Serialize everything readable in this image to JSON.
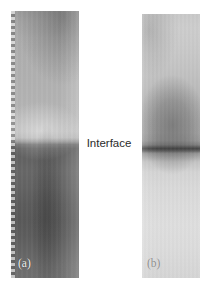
{
  "figure": {
    "type": "two-panel grayscale micrograph",
    "background_color": "#ffffff",
    "width_px": 213,
    "height_px": 289,
    "annotation": {
      "interface_label": "Interface",
      "interface_label_color": "#2b2b2b"
    },
    "panels": [
      {
        "id": "a",
        "caption": "(a)",
        "caption_color": "#f2f2f2",
        "x": 11,
        "y": 11,
        "width": 68,
        "height": 267,
        "overall_tone": "dark",
        "interface_position_percent": 49,
        "upper_region_color": "#b2b2b2",
        "bright_band_color": "#bdbdbd",
        "interface_line_color": "#5e5e5e",
        "lower_region_color": "#5f5f5f",
        "left_edge_artifact": "dashed film edge",
        "features": [
          "mid-gray upper region with darker top-right wash",
          "lens-shaped bright band immediately above the interface",
          "sharp dark horizontal interface near mid-height",
          "dark lower region with a vertical darker streak"
        ]
      },
      {
        "id": "b",
        "caption": "(b)",
        "caption_color": "#8d8d8d",
        "x": 142,
        "y": 14,
        "width": 58,
        "height": 264,
        "overall_tone": "light",
        "interface_position_percent": 50,
        "upper_region_color": "#c9c9c9",
        "blob_color": "#8f8f8f",
        "interface_line_color": "#6e6e6e",
        "lower_region_color": "#dcdcdc",
        "left_edge_artifact": "none",
        "features": [
          "light gray upper region",
          "dark rounded blob in the upper-middle area",
          "sharp dark horizontal interface near mid-height",
          "very light lower region"
        ]
      }
    ]
  }
}
